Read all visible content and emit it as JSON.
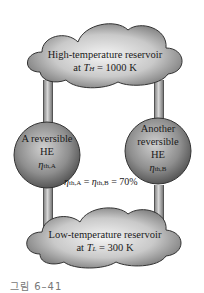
{
  "diagram": {
    "high_reservoir": {
      "line1": "High-temperature reservoir",
      "line2_prefix": "at ",
      "line2_var": "T",
      "line2_sub": "H",
      "line2_suffix": " = 1000 K"
    },
    "low_reservoir": {
      "line1": "Low-temperature reservoir",
      "line2_prefix": "at ",
      "line2_var": "T",
      "line2_sub": "L",
      "line2_suffix": " = 300 K"
    },
    "engine_a": {
      "line1": "A reversible",
      "line2": "HE",
      "eta": "η",
      "eta_sub": "th,A"
    },
    "engine_b": {
      "line1": "Another",
      "line2": "reversible",
      "line3": "HE",
      "eta": "η",
      "eta_sub": "th,B"
    },
    "equation": {
      "eta": "η",
      "sub_a": "th,A",
      "equals": " = ",
      "sub_b": "th,B",
      "result": " = 70%"
    },
    "caption": "그림 6–41"
  }
}
